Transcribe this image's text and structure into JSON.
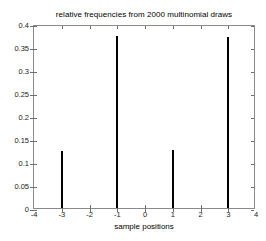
{
  "chart_data": {
    "type": "bar",
    "title": "relative frequencies from 2000 multinomial draws",
    "xlabel": "sample positions",
    "ylabel": "",
    "x": [
      -3,
      -1,
      1,
      3
    ],
    "categories": [
      "-3",
      "-1",
      "1",
      "3"
    ],
    "values": [
      0.124,
      0.373,
      0.126,
      0.372
    ],
    "xlim": [
      -4,
      4
    ],
    "ylim": [
      0,
      0.4
    ],
    "xticks": [
      -4,
      -3,
      -2,
      -1,
      0,
      1,
      2,
      3,
      4
    ],
    "xticklabels": [
      "-4",
      "-3",
      "-2",
      "-1",
      "0",
      "1",
      "2",
      "3",
      "4"
    ],
    "yticks": [
      0,
      0.05,
      0.1,
      0.15,
      0.2,
      0.25,
      0.3,
      0.35,
      0.4
    ],
    "yticklabels": [
      "0",
      "0.05",
      "0.1",
      "0.15",
      "0.2",
      "0.25",
      "0.3",
      "0.35",
      "0.4"
    ],
    "grid": false,
    "legend": null,
    "bar_color": "#000000",
    "axes_color": "#8a8a8a",
    "background": "#ffffff",
    "bar_width_px": 2
  }
}
